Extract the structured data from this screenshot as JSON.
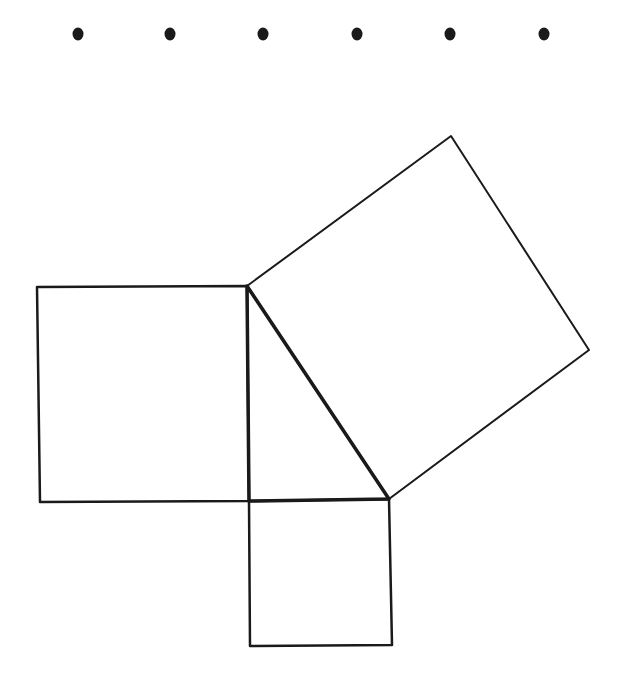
{
  "diagram": {
    "title": "",
    "background": "#ffffff",
    "stroke_color": "#1a1a1a",
    "dots": {
      "y": 34,
      "r": 5.5,
      "x": [
        78,
        170,
        263,
        357,
        450,
        544
      ]
    },
    "triangle": {
      "right_angle_vertex": [
        249,
        501
      ],
      "top_vertex": [
        247,
        286
      ],
      "right_vertex": [
        389,
        499
      ]
    },
    "squares": [
      {
        "name": "left-square-leg-a",
        "points": [
          [
            37,
            287
          ],
          [
            247,
            286
          ],
          [
            249,
            501
          ],
          [
            40,
            502
          ]
        ]
      },
      {
        "name": "bottom-square-leg-b",
        "points": [
          [
            249,
            501
          ],
          [
            389,
            499
          ],
          [
            392,
            645
          ],
          [
            250,
            646
          ]
        ]
      },
      {
        "name": "hypotenuse-square",
        "points": [
          [
            247,
            286
          ],
          [
            451,
            136
          ],
          [
            589,
            350
          ],
          [
            389,
            499
          ]
        ]
      }
    ]
  }
}
